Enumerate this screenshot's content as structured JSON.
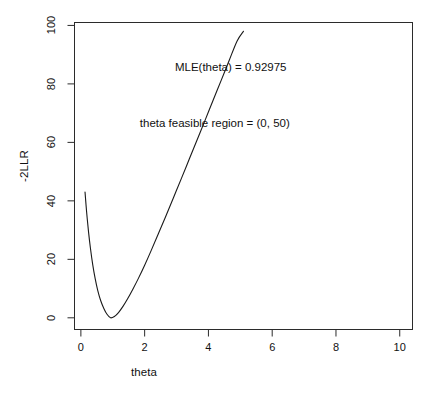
{
  "chart_data": {
    "type": "line",
    "title": "",
    "subtitle": "",
    "xlabel": "theta",
    "ylabel": "-2LLR",
    "xlim": [
      -0.2,
      10.4
    ],
    "ylim": [
      -4,
      101
    ],
    "grid": false,
    "legend": null,
    "xticks": [
      0,
      2,
      4,
      6,
      8,
      10
    ],
    "xtick_labels": [
      "0",
      "2",
      "4",
      "6",
      "8",
      "10"
    ],
    "yticks": [
      0,
      20,
      40,
      60,
      80,
      100
    ],
    "ytick_labels": [
      "0",
      "20",
      "40",
      "60",
      "80",
      "100"
    ],
    "series": [
      {
        "name": "-2LLR(theta)",
        "x": [
          0.13,
          0.18,
          0.24,
          0.3,
          0.37,
          0.45,
          0.53,
          0.62,
          0.72,
          0.82,
          0.93,
          1.05,
          1.18,
          1.32,
          1.47,
          1.63,
          1.8,
          2.0,
          2.2,
          2.42,
          2.65,
          2.9,
          3.15,
          3.4,
          3.65,
          3.9,
          4.15,
          4.4,
          4.65,
          4.9,
          5.1
        ],
        "y": [
          43.0,
          36.2,
          29.4,
          23.8,
          18.3,
          13.3,
          9.3,
          5.9,
          3.2,
          1.2,
          0.0,
          0.45,
          1.8,
          3.9,
          6.6,
          9.8,
          13.4,
          18.0,
          22.9,
          28.5,
          34.4,
          41.0,
          47.6,
          54.3,
          61.0,
          67.7,
          74.5,
          81.2,
          88.0,
          94.7,
          98.0
        ]
      }
    ],
    "annotations": [
      {
        "text": "MLE(theta) = 0.92975",
        "x": 4.7,
        "y": 85
      },
      {
        "text": "theta feasible region = (0, 50)",
        "x": 4.2,
        "y": 66
      }
    ],
    "mle_theta": 0.92975,
    "feasible_region": "(0, 50)",
    "line_color": "#1a1a1a",
    "axis_color": "#2b2b2b",
    "background_color": "#ffffff"
  }
}
